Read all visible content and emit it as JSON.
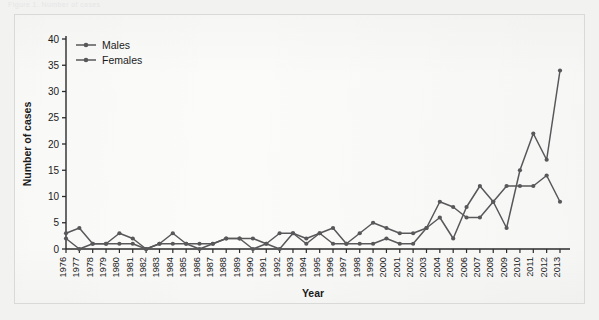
{
  "figure": {
    "scan_top_fragment": "Figure 1. Number of cases",
    "background_color": "#f2f2f1",
    "panel_color": "#fbfbfa",
    "line_color": "#58585a",
    "axis_color": "#2b2b2b"
  },
  "chart_data": {
    "type": "line",
    "title": "",
    "xlabel": "Year",
    "ylabel": "Number of cases",
    "xlim": [
      1976,
      2013
    ],
    "ylim": [
      0,
      40
    ],
    "yticks": [
      0,
      5,
      10,
      15,
      20,
      25,
      30,
      35,
      40
    ],
    "grid": false,
    "legend_position": "top-left",
    "categories": [
      "1976",
      "1977",
      "1978",
      "1979",
      "1980",
      "1981",
      "1982",
      "1983",
      "1984",
      "1985",
      "1986",
      "1987",
      "1988",
      "1989",
      "1990",
      "1991",
      "1992",
      "1993",
      "1994",
      "1995",
      "1996",
      "1997",
      "1998",
      "1999",
      "2000",
      "2001",
      "2002",
      "2003",
      "2004",
      "2005",
      "2006",
      "2007",
      "2008",
      "2009",
      "2010",
      "2011",
      "2012",
      "2013"
    ],
    "series": [
      {
        "name": "Males",
        "color": "#58585a",
        "marker": "circle",
        "values": [
          3,
          4,
          1,
          1,
          3,
          2,
          0,
          1,
          3,
          1,
          1,
          1,
          2,
          2,
          0,
          1,
          3,
          3,
          2,
          3,
          4,
          1,
          3,
          5,
          4,
          3,
          3,
          4,
          9,
          8,
          6,
          6,
          9,
          12,
          12,
          12,
          14,
          9
        ]
      },
      {
        "name": "Females",
        "color": "#58585a",
        "marker": "circle",
        "values": [
          2,
          0,
          1,
          1,
          1,
          1,
          0,
          1,
          1,
          1,
          0,
          1,
          2,
          2,
          2,
          1,
          0,
          3,
          1,
          3,
          1,
          1,
          1,
          1,
          2,
          1,
          1,
          4,
          6,
          2,
          8,
          12,
          9,
          4,
          15,
          22,
          17,
          34
        ]
      }
    ]
  },
  "legend": {
    "items": [
      {
        "label": "Males"
      },
      {
        "label": "Females"
      }
    ]
  }
}
